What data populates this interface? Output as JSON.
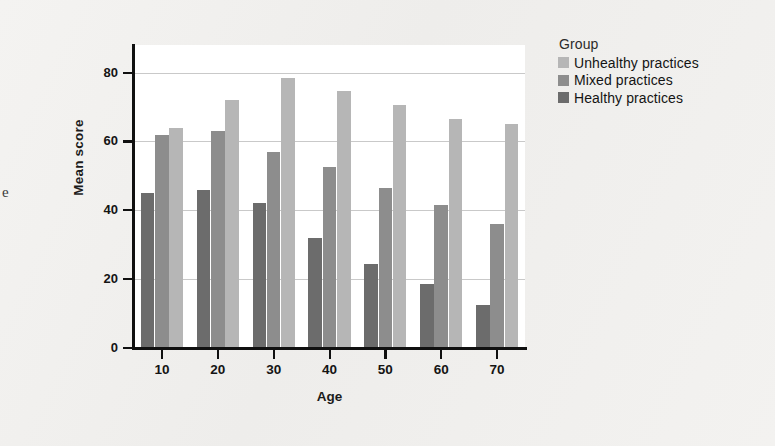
{
  "figure": {
    "margin_glyph": "e"
  },
  "legend": {
    "title": "Group",
    "entries": [
      {
        "label": "Unhealthy practices",
        "color": "#b6b6b6",
        "key": "unhealthy"
      },
      {
        "label": "Mixed practices",
        "color": "#8d8d8d",
        "key": "mixed"
      },
      {
        "label": "Healthy practices",
        "color": "#6c6c6c",
        "key": "healthy"
      }
    ]
  },
  "chart_data": {
    "type": "bar",
    "title": "",
    "xlabel": "Age",
    "ylabel": "Mean score",
    "categories": [
      "10",
      "20",
      "30",
      "40",
      "50",
      "60",
      "70"
    ],
    "series": [
      {
        "name": "Healthy practices",
        "color": "#6c6c6c",
        "values": [
          45,
          46,
          42,
          32,
          24.5,
          18.5,
          12.5
        ]
      },
      {
        "name": "Mixed practices",
        "color": "#8d8d8d",
        "values": [
          62,
          63,
          57,
          52.5,
          46.5,
          41.5,
          36
        ]
      },
      {
        "name": "Unhealthy practices",
        "color": "#b6b6b6",
        "values": [
          64,
          72,
          78.5,
          74.5,
          70.5,
          66.5,
          65
        ]
      }
    ],
    "ylim": [
      0,
      88
    ],
    "yticks": [
      0,
      20,
      40,
      60,
      80
    ],
    "ytick_labels": [
      "0",
      "20",
      "40",
      "60",
      "80"
    ],
    "grid": true,
    "grid_axis": "y",
    "legend_position": "right",
    "bar_order_in_group": [
      "Healthy practices",
      "Mixed practices",
      "Unhealthy practices"
    ]
  }
}
